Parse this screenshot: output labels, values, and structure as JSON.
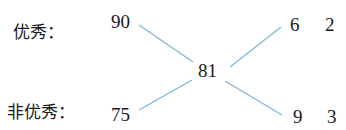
{
  "diagram": {
    "type": "cross-mixing",
    "rows": [
      {
        "label": "优秀：",
        "value": "90",
        "difference": "6",
        "ratio": "2"
      },
      {
        "label": "非优秀：",
        "value": "75",
        "difference": "9",
        "ratio": "3"
      }
    ],
    "center": "81",
    "line_color": "#7fb6d6"
  }
}
